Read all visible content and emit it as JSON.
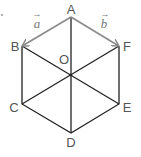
{
  "diagram": {
    "type": "regular hexagon with vectors",
    "vertices": {
      "A": {
        "label": "A",
        "x": 71,
        "y": 17
      },
      "B": {
        "label": "B",
        "x": 22,
        "y": 46
      },
      "C": {
        "label": "C",
        "x": 22,
        "y": 104
      },
      "D": {
        "label": "D",
        "x": 71,
        "y": 133
      },
      "E": {
        "label": "E",
        "x": 119,
        "y": 104
      },
      "F": {
        "label": "F",
        "x": 119,
        "y": 46
      }
    },
    "center": {
      "label": "O",
      "x": 71,
      "y": 75
    },
    "vectors": [
      {
        "name": "a",
        "label": "a",
        "arrow": "→",
        "from": "A",
        "to": "B",
        "color": "#8a8a8a"
      },
      {
        "name": "b",
        "label": "b",
        "arrow": "→",
        "from": "A",
        "to": "F",
        "color": "#8a8a8a"
      }
    ],
    "diagonals": [
      "AD",
      "BE",
      "CF"
    ],
    "colors": {
      "edge": "#222222",
      "vector": "#8a8a8a",
      "label": "#555555"
    }
  }
}
